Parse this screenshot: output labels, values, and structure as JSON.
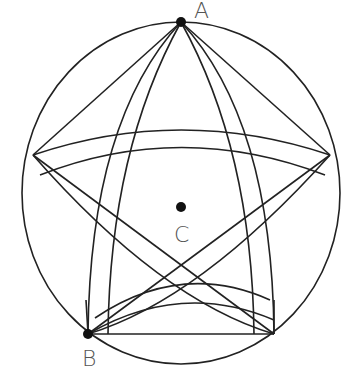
{
  "diagram": {
    "stroke_color": "#222222",
    "point_color": "#111111",
    "label_color": "#555555",
    "points": [
      {
        "id": "A",
        "label": "A",
        "x": 181,
        "y": 22
      },
      {
        "id": "B",
        "label": "B",
        "x": 88,
        "y": 334
      },
      {
        "id": "C",
        "label": "C",
        "x": 181,
        "y": 207
      }
    ],
    "vertices": [
      {
        "x": 181,
        "y": 22
      },
      {
        "x": 330,
        "y": 155
      },
      {
        "x": 274,
        "y": 334
      },
      {
        "x": 88,
        "y": 334
      },
      {
        "x": 33,
        "y": 155
      }
    ],
    "outer_circle": {
      "cx": 181,
      "cy": 193,
      "rx": 159,
      "ry": 171
    }
  }
}
